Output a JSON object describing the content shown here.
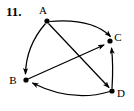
{
  "figure": {
    "problem_number": "11.",
    "type": "directed-graph",
    "stroke_color": "#000000",
    "background_color": "#ffffff"
  },
  "graph": {
    "vertices": [
      {
        "id": "A",
        "label": "A",
        "x": 47,
        "y": 21,
        "label_x": 43,
        "label_y": 14
      },
      {
        "id": "B",
        "label": "B",
        "x": 26,
        "y": 80,
        "label_x": 11,
        "label_y": 84
      },
      {
        "id": "C",
        "label": "C",
        "x": 110,
        "y": 41,
        "label_x": 115,
        "label_y": 41
      },
      {
        "id": "D",
        "label": "D",
        "x": 112,
        "y": 91,
        "label_x": 117,
        "label_y": 97
      }
    ],
    "edges": [
      {
        "from": "A",
        "to": "C",
        "shape": "curved",
        "label": "A to C"
      },
      {
        "from": "A",
        "to": "B",
        "shape": "curved",
        "label": "A to B"
      },
      {
        "from": "A",
        "to": "D",
        "shape": "straight",
        "label": "A to D"
      },
      {
        "from": "B",
        "to": "C",
        "shape": "straight",
        "label": "B to C"
      },
      {
        "from": "D",
        "to": "C",
        "shape": "straight",
        "label": "D to C"
      },
      {
        "from": "D",
        "to": "B",
        "shape": "curved",
        "label": "D to B"
      }
    ]
  }
}
